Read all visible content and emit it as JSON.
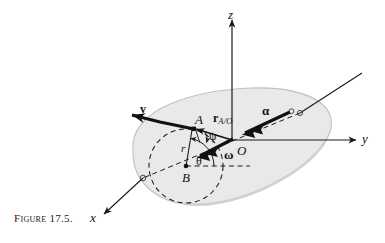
{
  "figure": {
    "caption": "Figure 17.5.",
    "body_fill_color": "#e9e9e9",
    "body_edge_color": "#b8b8b8",
    "ink_color": "#111111"
  },
  "axes": [
    {
      "id": "z",
      "label": "z",
      "direction": "up"
    },
    {
      "id": "y",
      "label": "y",
      "direction": "right"
    },
    {
      "id": "x",
      "label": "x",
      "direction": "lower-left"
    }
  ],
  "points": [
    {
      "id": "O",
      "label": "O",
      "role": "origin"
    },
    {
      "id": "A",
      "label": "A",
      "role": "point-on-body"
    },
    {
      "id": "B",
      "label": "B",
      "role": "circle-center"
    }
  ],
  "vectors": [
    {
      "id": "v",
      "label": "v",
      "kind": "velocity",
      "arrowheads": 1
    },
    {
      "id": "r_AO",
      "label": "r",
      "subscript": "A/O",
      "kind": "position",
      "arrowheads": 1
    },
    {
      "id": "alpha",
      "label": "α",
      "kind": "angular-acceleration",
      "arrowheads": 2
    },
    {
      "id": "omega",
      "label": "ω",
      "kind": "angular-velocity",
      "arrowheads": 2
    }
  ],
  "angles": [
    {
      "id": "psi",
      "label": "ψ",
      "at_point": "A"
    },
    {
      "id": "theta",
      "label": "θ",
      "at_point": "B"
    }
  ],
  "scalars": [
    {
      "id": "r",
      "label": "r",
      "meaning": "radius from B to A"
    }
  ]
}
